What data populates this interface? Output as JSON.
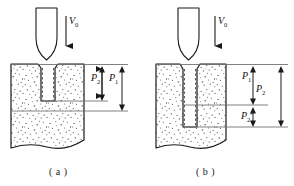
{
  "figure": {
    "type": "technical-diagram",
    "background_color": "#ffffff",
    "line_color": "#1a1a1a",
    "stipple_color": "#555555"
  },
  "panels": [
    {
      "id": "a",
      "caption": "( a )",
      "velocity_label": "V",
      "velocity_subscript": "0",
      "arrow_direction": "down",
      "penetration_state": "shallow",
      "dimensions": [
        {
          "id": "a-p2",
          "symbol": "P",
          "subscript": "2",
          "prime": "",
          "meaning": "cavity-depth"
        },
        {
          "id": "a-p1",
          "symbol": "P",
          "subscript": "1",
          "prime": "",
          "meaning": "total-penetration-depth"
        }
      ]
    },
    {
      "id": "b",
      "caption": "( b )",
      "velocity_label": "V",
      "velocity_subscript": "0",
      "arrow_direction": "down",
      "penetration_state": "deep",
      "dimensions": [
        {
          "id": "b-p1",
          "symbol": "P",
          "subscript": "1",
          "prime": "",
          "meaning": "upper-segment-depth"
        },
        {
          "id": "b-p2",
          "symbol": "P",
          "subscript": "2",
          "prime": "",
          "meaning": "total-cavity-depth"
        },
        {
          "id": "b-p2p",
          "symbol": "P",
          "subscript": "2",
          "prime": "'",
          "meaning": "lower-segment-depth"
        }
      ]
    }
  ]
}
